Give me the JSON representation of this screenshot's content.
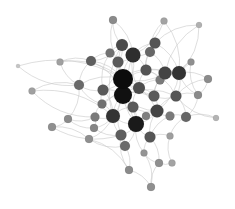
{
  "graph": {
    "type": "network",
    "width": 235,
    "height": 209,
    "background": "#ffffff",
    "edge_color": "#c8c8c8",
    "nodes": [
      {
        "id": 0,
        "x": 113,
        "y": 20,
        "r": 4,
        "color": "#8a8a8a"
      },
      {
        "id": 1,
        "x": 164,
        "y": 21,
        "r": 3.5,
        "color": "#a3a3a3"
      },
      {
        "id": 2,
        "x": 199,
        "y": 25,
        "r": 3,
        "color": "#b0b0b0"
      },
      {
        "id": 3,
        "x": 122,
        "y": 45,
        "r": 6,
        "color": "#4a4a4a"
      },
      {
        "id": 4,
        "x": 155,
        "y": 43,
        "r": 5.5,
        "color": "#555555"
      },
      {
        "id": 5,
        "x": 133,
        "y": 55,
        "r": 7.5,
        "color": "#2e2e2e"
      },
      {
        "id": 6,
        "x": 110,
        "y": 53,
        "r": 4.5,
        "color": "#727272"
      },
      {
        "id": 7,
        "x": 150,
        "y": 52,
        "r": 5,
        "color": "#676767"
      },
      {
        "id": 8,
        "x": 18,
        "y": 66,
        "r": 2,
        "color": "#c4c4c4"
      },
      {
        "id": 9,
        "x": 91,
        "y": 61,
        "r": 5,
        "color": "#5e5e5e"
      },
      {
        "id": 10,
        "x": 118,
        "y": 62,
        "r": 5.5,
        "color": "#5a5a5a"
      },
      {
        "id": 11,
        "x": 60,
        "y": 62,
        "r": 3.5,
        "color": "#a0a0a0"
      },
      {
        "id": 12,
        "x": 191,
        "y": 62,
        "r": 3.5,
        "color": "#8f8f8f"
      },
      {
        "id": 13,
        "x": 123,
        "y": 79,
        "r": 10,
        "color": "#0c0c0c"
      },
      {
        "id": 14,
        "x": 146,
        "y": 70,
        "r": 5.5,
        "color": "#555555"
      },
      {
        "id": 15,
        "x": 165,
        "y": 73,
        "r": 6.5,
        "color": "#444444"
      },
      {
        "id": 16,
        "x": 179,
        "y": 73,
        "r": 7,
        "color": "#333333"
      },
      {
        "id": 17,
        "x": 208,
        "y": 79,
        "r": 4,
        "color": "#8c8c8c"
      },
      {
        "id": 18,
        "x": 32,
        "y": 91,
        "r": 3.5,
        "color": "#a0a0a0"
      },
      {
        "id": 19,
        "x": 79,
        "y": 85,
        "r": 5,
        "color": "#6a6a6a"
      },
      {
        "id": 20,
        "x": 103,
        "y": 90,
        "r": 5.5,
        "color": "#5a5a5a"
      },
      {
        "id": 21,
        "x": 139,
        "y": 88,
        "r": 6,
        "color": "#4d4d4d"
      },
      {
        "id": 22,
        "x": 160,
        "y": 80,
        "r": 4.5,
        "color": "#7a7a7a"
      },
      {
        "id": 23,
        "x": 123,
        "y": 95,
        "r": 9,
        "color": "#111111"
      },
      {
        "id": 24,
        "x": 198,
        "y": 95,
        "r": 4,
        "color": "#8a8a8a"
      },
      {
        "id": 25,
        "x": 154,
        "y": 96,
        "r": 5.5,
        "color": "#5a5a5a"
      },
      {
        "id": 26,
        "x": 176,
        "y": 96,
        "r": 5.5,
        "color": "#555555"
      },
      {
        "id": 27,
        "x": 102,
        "y": 104,
        "r": 4.5,
        "color": "#727272"
      },
      {
        "id": 28,
        "x": 133,
        "y": 107,
        "r": 5.5,
        "color": "#5a5a5a"
      },
      {
        "id": 29,
        "x": 157,
        "y": 111,
        "r": 6.5,
        "color": "#444444"
      },
      {
        "id": 30,
        "x": 95,
        "y": 117,
        "r": 4.5,
        "color": "#7a7a7a"
      },
      {
        "id": 31,
        "x": 113,
        "y": 116,
        "r": 7,
        "color": "#333333"
      },
      {
        "id": 32,
        "x": 146,
        "y": 116,
        "r": 4,
        "color": "#7f7f7f"
      },
      {
        "id": 33,
        "x": 170,
        "y": 116,
        "r": 4.5,
        "color": "#7a7a7a"
      },
      {
        "id": 34,
        "x": 186,
        "y": 117,
        "r": 5,
        "color": "#666666"
      },
      {
        "id": 35,
        "x": 68,
        "y": 119,
        "r": 4,
        "color": "#8a8a8a"
      },
      {
        "id": 36,
        "x": 216,
        "y": 118,
        "r": 3,
        "color": "#b3b3b3"
      },
      {
        "id": 37,
        "x": 52,
        "y": 127,
        "r": 4,
        "color": "#8f8f8f"
      },
      {
        "id": 38,
        "x": 94,
        "y": 128,
        "r": 4,
        "color": "#858585"
      },
      {
        "id": 39,
        "x": 136,
        "y": 124,
        "r": 8,
        "color": "#1a1a1a"
      },
      {
        "id": 40,
        "x": 121,
        "y": 135,
        "r": 5.5,
        "color": "#5e5e5e"
      },
      {
        "id": 41,
        "x": 150,
        "y": 137,
        "r": 5.5,
        "color": "#555555"
      },
      {
        "id": 42,
        "x": 89,
        "y": 139,
        "r": 4,
        "color": "#8f8f8f"
      },
      {
        "id": 43,
        "x": 170,
        "y": 136,
        "r": 3.5,
        "color": "#9e9e9e"
      },
      {
        "id": 44,
        "x": 125,
        "y": 146,
        "r": 5,
        "color": "#6a6a6a"
      },
      {
        "id": 45,
        "x": 144,
        "y": 153,
        "r": 3.5,
        "color": "#949494"
      },
      {
        "id": 46,
        "x": 159,
        "y": 163,
        "r": 4,
        "color": "#8f8f8f"
      },
      {
        "id": 47,
        "x": 172,
        "y": 163,
        "r": 3.5,
        "color": "#a3a3a3"
      },
      {
        "id": 48,
        "x": 129,
        "y": 170,
        "r": 4,
        "color": "#8a8a8a"
      },
      {
        "id": 49,
        "x": 151,
        "y": 187,
        "r": 4,
        "color": "#8f8f8f"
      }
    ],
    "edges": [
      [
        0,
        3
      ],
      [
        0,
        5
      ],
      [
        0,
        10
      ],
      [
        1,
        5
      ],
      [
        1,
        7
      ],
      [
        1,
        16
      ],
      [
        2,
        4
      ],
      [
        2,
        16
      ],
      [
        2,
        15
      ],
      [
        3,
        5
      ],
      [
        3,
        6
      ],
      [
        3,
        10
      ],
      [
        3,
        13
      ],
      [
        3,
        9
      ],
      [
        4,
        5
      ],
      [
        4,
        7
      ],
      [
        4,
        14
      ],
      [
        4,
        16
      ],
      [
        5,
        7
      ],
      [
        5,
        10
      ],
      [
        5,
        13
      ],
      [
        5,
        14
      ],
      [
        5,
        21
      ],
      [
        5,
        23
      ],
      [
        6,
        9
      ],
      [
        6,
        13
      ],
      [
        7,
        14
      ],
      [
        7,
        15
      ],
      [
        8,
        19
      ],
      [
        8,
        13
      ],
      [
        9,
        11
      ],
      [
        9,
        13
      ],
      [
        9,
        19
      ],
      [
        9,
        23
      ],
      [
        10,
        13
      ],
      [
        10,
        20
      ],
      [
        11,
        19
      ],
      [
        11,
        13
      ],
      [
        12,
        16
      ],
      [
        12,
        15
      ],
      [
        12,
        24
      ],
      [
        13,
        14
      ],
      [
        13,
        19
      ],
      [
        13,
        20
      ],
      [
        13,
        21
      ],
      [
        13,
        23
      ],
      [
        13,
        15
      ],
      [
        13,
        16
      ],
      [
        13,
        25
      ],
      [
        13,
        27
      ],
      [
        13,
        39
      ],
      [
        14,
        15
      ],
      [
        14,
        21
      ],
      [
        14,
        22
      ],
      [
        15,
        16
      ],
      [
        15,
        22
      ],
      [
        15,
        25
      ],
      [
        16,
        17
      ],
      [
        16,
        22
      ],
      [
        16,
        26
      ],
      [
        16,
        24
      ],
      [
        17,
        24
      ],
      [
        17,
        26
      ],
      [
        18,
        31
      ],
      [
        18,
        30
      ],
      [
        18,
        19
      ],
      [
        19,
        20
      ],
      [
        19,
        35
      ],
      [
        19,
        27
      ],
      [
        20,
        23
      ],
      [
        20,
        27
      ],
      [
        20,
        31
      ],
      [
        21,
        23
      ],
      [
        21,
        25
      ],
      [
        21,
        28
      ],
      [
        21,
        22
      ],
      [
        22,
        25
      ],
      [
        23,
        25
      ],
      [
        23,
        27
      ],
      [
        23,
        28
      ],
      [
        23,
        31
      ],
      [
        23,
        39
      ],
      [
        23,
        29
      ],
      [
        23,
        26
      ],
      [
        24,
        26
      ],
      [
        24,
        34
      ],
      [
        25,
        26
      ],
      [
        25,
        29
      ],
      [
        26,
        29
      ],
      [
        26,
        34
      ],
      [
        27,
        30
      ],
      [
        27,
        31
      ],
      [
        28,
        31
      ],
      [
        28,
        39
      ],
      [
        28,
        29
      ],
      [
        29,
        32
      ],
      [
        29,
        33
      ],
      [
        29,
        39
      ],
      [
        29,
        41
      ],
      [
        30,
        35
      ],
      [
        30,
        31
      ],
      [
        30,
        38
      ],
      [
        31,
        39
      ],
      [
        31,
        38
      ],
      [
        31,
        40
      ],
      [
        31,
        42
      ],
      [
        32,
        39
      ],
      [
        33,
        34
      ],
      [
        33,
        41
      ],
      [
        34,
        36
      ],
      [
        34,
        43
      ],
      [
        35,
        37
      ],
      [
        35,
        38
      ],
      [
        36,
        26
      ],
      [
        37,
        40
      ],
      [
        37,
        42
      ],
      [
        38,
        40
      ],
      [
        39,
        40
      ],
      [
        39,
        41
      ],
      [
        39,
        44
      ],
      [
        39,
        45
      ],
      [
        40,
        44
      ],
      [
        40,
        48
      ],
      [
        41,
        43
      ],
      [
        41,
        45
      ],
      [
        41,
        46
      ],
      [
        42,
        44
      ],
      [
        42,
        48
      ],
      [
        43,
        47
      ],
      [
        44,
        48
      ],
      [
        45,
        46
      ],
      [
        45,
        49
      ],
      [
        46,
        47
      ],
      [
        48,
        49
      ],
      [
        46,
        49
      ],
      [
        13,
        31
      ],
      [
        23,
        40
      ],
      [
        16,
        29
      ],
      [
        5,
        39
      ],
      [
        13,
        29
      ],
      [
        3,
        31
      ],
      [
        14,
        26
      ],
      [
        6,
        20
      ]
    ]
  }
}
